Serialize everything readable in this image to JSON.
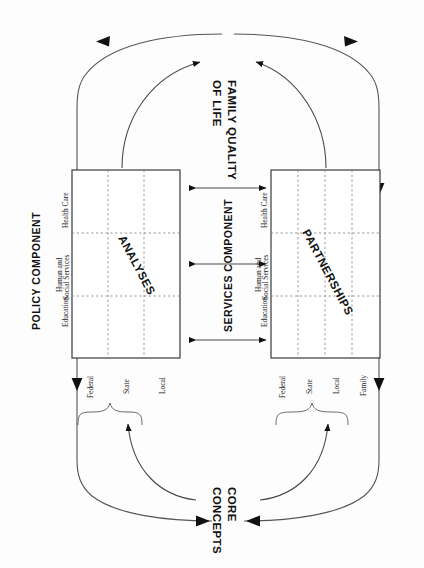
{
  "diagram": {
    "title_top": "FAMILY QUALITY OF LIFE",
    "title_top_line1": "FAMILY QUALITY",
    "title_top_line2": "OF LIFE",
    "title_bottom_line1": "CORE",
    "title_bottom_line2": "CONCEPTS",
    "left_component": "POLICY COMPONENT",
    "center_component": "SERVICES  COMPONENT",
    "matrices": [
      {
        "id": "analyses",
        "name": "ANALYSES",
        "columns": [
          "Education",
          "Human and Social Services",
          "Health Care"
        ],
        "column_lines": [
          [
            "Education"
          ],
          [
            "Human and",
            "Social Services"
          ],
          [
            "Health Care"
          ]
        ],
        "rows": [
          "Federal",
          "State",
          "Local"
        ]
      },
      {
        "id": "partnerships",
        "name": "PARTNERSHIPS",
        "columns": [
          "Education",
          "Human and Social Services",
          "Health Care"
        ],
        "column_lines": [
          [
            "Education"
          ],
          [
            "Human and",
            "Social Services"
          ],
          [
            "Health Care"
          ]
        ],
        "rows": [
          "Federal",
          "State",
          "Local",
          "Family"
        ]
      }
    ],
    "colors": {
      "ink": "#111111",
      "line": "#4a4a4a",
      "grid": "#8a8a8a",
      "background": "#ffffff"
    }
  }
}
